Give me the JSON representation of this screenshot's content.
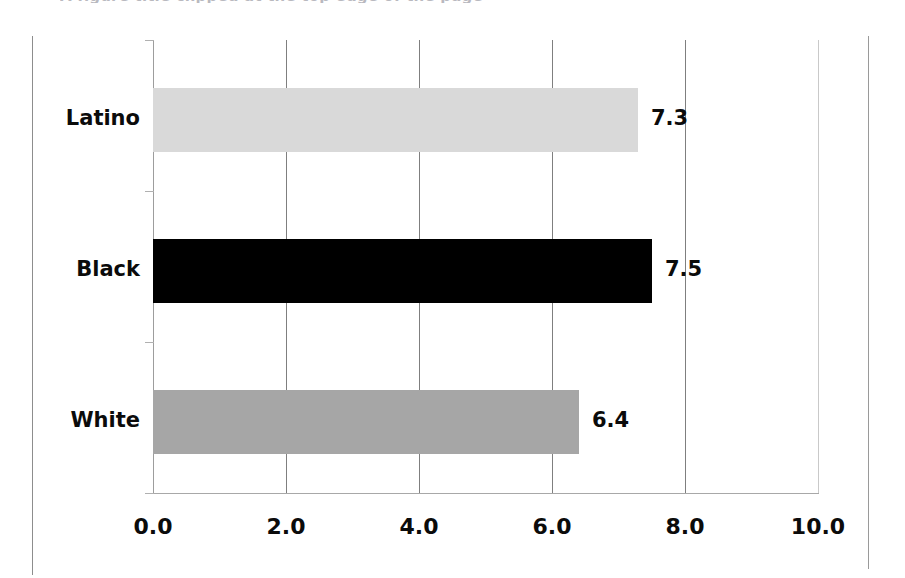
{
  "figure": {
    "title_remnant": "A figure title clipped at the top edge of the page",
    "background_color": "#ffffff"
  },
  "axis": {
    "tick_labels": [
      "0.0",
      "2.0",
      "4.0",
      "6.0",
      "8.0",
      "10.0"
    ],
    "category_labels": [
      "Latino",
      "Black",
      "White"
    ]
  },
  "bars": [
    {
      "category": "Latino",
      "value": 7.3,
      "value_label": "7.3",
      "color": "#d9d9d9"
    },
    {
      "category": "Black",
      "value": 7.5,
      "value_label": "7.5",
      "color": "#000000"
    },
    {
      "category": "White",
      "value": 6.4,
      "value_label": "6.4",
      "color": "#a6a6a6"
    }
  ],
  "chart_data": {
    "type": "bar",
    "orientation": "horizontal",
    "title": "",
    "subtitle": "",
    "xlabel": "",
    "ylabel": "",
    "categories": [
      "Latino",
      "Black",
      "White"
    ],
    "values": [
      7.3,
      7.5,
      6.4
    ],
    "data_labels": [
      "7.3",
      "7.5",
      "6.4"
    ],
    "bar_colors": [
      "#d9d9d9",
      "#000000",
      "#a6a6a6"
    ],
    "xlim": [
      0.0,
      10.0
    ],
    "xticks": [
      0.0,
      2.0,
      4.0,
      6.0,
      8.0,
      10.0
    ],
    "xtick_labels": [
      "0.0",
      "2.0",
      "4.0",
      "6.0",
      "8.0",
      "10.0"
    ],
    "grid": "vertical gridlines at each x tick",
    "legend": "none",
    "category_order_top_to_bottom": [
      "Latino",
      "Black",
      "White"
    ]
  }
}
